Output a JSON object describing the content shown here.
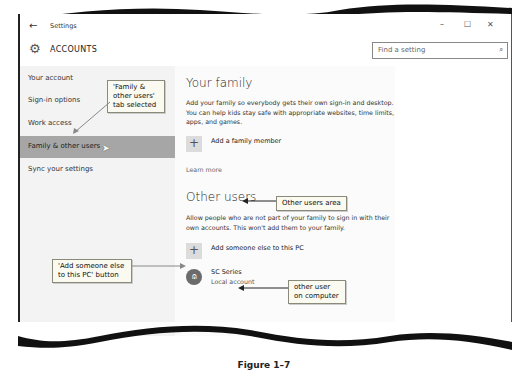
{
  "window": {
    "title": "Settings",
    "controls": {
      "minimize": "–",
      "maximize": "☐",
      "close": "✕"
    }
  },
  "header": {
    "section_title": "ACCOUNTS",
    "icon": "gear-icon",
    "search": {
      "placeholder": "Find a setting",
      "value": ""
    }
  },
  "sidebar": {
    "items": [
      {
        "label": "Your account",
        "selected": false
      },
      {
        "label": "Sign-in options",
        "selected": false
      },
      {
        "label": "Work access",
        "selected": false
      },
      {
        "label": "Family & other users",
        "selected": true
      },
      {
        "label": "Sync your settings",
        "selected": false
      }
    ]
  },
  "main": {
    "your_family": {
      "heading": "Your family",
      "description": "Add your family so everybody gets their own sign-in and desktop. You can help kids stay safe with appropriate websites, time limits, apps, and games.",
      "add_button_label": "Add a family member",
      "learn_more": "Learn more"
    },
    "other_users": {
      "heading": "Other users",
      "description": "Allow people who are not part of your family to sign in with their own accounts. This won't add them to your family.",
      "add_button_label": "Add someone else to this PC",
      "users": [
        {
          "name": "SC Series",
          "type": "Local account"
        }
      ]
    }
  },
  "callouts": {
    "tab_selected": "'Family & other users' tab selected",
    "other_users_area": "Other users area",
    "add_someone": "'Add someone else to this PC' button",
    "other_user": "other user on computer"
  },
  "caption": "Figure 1–7"
}
